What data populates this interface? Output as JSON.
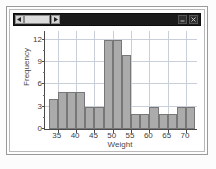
{
  "window": {
    "titlebar": {
      "scroll_left_icon": "triangle-left-icon",
      "scroll_right_icon": "triangle-right-icon",
      "scroll_thumb": "scrollbar-thumb",
      "minimize_icon": "minimize-icon",
      "close_icon": "close-icon"
    }
  },
  "colors": {
    "bar_fill": "#ababab",
    "bar_stroke": "#777777",
    "gridline": "#c8cfd8",
    "axis": "#4a4a4a",
    "titlebar": "#1b1b1b",
    "plot_background": "#ffffff"
  },
  "chart_data": {
    "type": "bar",
    "chart_subtype": "histogram",
    "title": "",
    "xlabel": "Weight",
    "ylabel": "Frequency",
    "xlim": [
      31.5,
      73.0
    ],
    "ylim": [
      0,
      13.2
    ],
    "grid": true,
    "legend": false,
    "bin_width": 2.5,
    "xticks": [
      35,
      40,
      45,
      50,
      55,
      60,
      65,
      70
    ],
    "xtick_labels": [
      "35",
      "40",
      "45",
      "50",
      "55",
      "60",
      "65",
      "70"
    ],
    "yticks": [
      0,
      3,
      6,
      9,
      12
    ],
    "ytick_labels": [
      "0",
      "3",
      "6",
      "9",
      "12"
    ],
    "yticks_minor": [
      1.5,
      4.5,
      7.5,
      10.5
    ],
    "bins": [
      {
        "start": 32.5,
        "end": 35.0,
        "value": 4
      },
      {
        "start": 35.0,
        "end": 37.5,
        "value": 5
      },
      {
        "start": 37.5,
        "end": 40.0,
        "value": 5
      },
      {
        "start": 40.0,
        "end": 42.5,
        "value": 5
      },
      {
        "start": 42.5,
        "end": 45.0,
        "value": 3
      },
      {
        "start": 45.0,
        "end": 47.5,
        "value": 3
      },
      {
        "start": 47.5,
        "end": 50.0,
        "value": 12
      },
      {
        "start": 50.0,
        "end": 52.5,
        "value": 12
      },
      {
        "start": 52.5,
        "end": 55.0,
        "value": 10
      },
      {
        "start": 55.0,
        "end": 57.5,
        "value": 2
      },
      {
        "start": 57.5,
        "end": 60.0,
        "value": 2
      },
      {
        "start": 60.0,
        "end": 62.5,
        "value": 3
      },
      {
        "start": 62.5,
        "end": 65.0,
        "value": 2
      },
      {
        "start": 65.0,
        "end": 67.5,
        "value": 2
      },
      {
        "start": 67.5,
        "end": 70.0,
        "value": 3
      },
      {
        "start": 70.0,
        "end": 72.5,
        "value": 3
      }
    ],
    "categories": [
      "32.5-35",
      "35-37.5",
      "37.5-40",
      "40-42.5",
      "42.5-45",
      "45-47.5",
      "47.5-50",
      "50-52.5",
      "52.5-55",
      "55-57.5",
      "57.5-60",
      "60-62.5",
      "62.5-65",
      "65-67.5",
      "67.5-70",
      "70-72.5"
    ],
    "values": [
      4,
      5,
      5,
      5,
      3,
      3,
      12,
      12,
      10,
      2,
      2,
      3,
      2,
      2,
      3,
      3
    ]
  }
}
